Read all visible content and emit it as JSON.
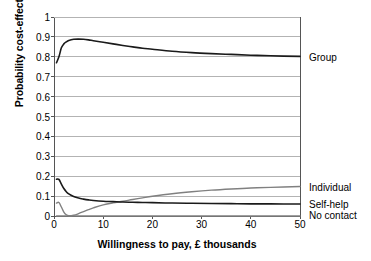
{
  "chart_data": {
    "type": "line",
    "title": "",
    "xlabel": "Willingness to pay, £ thousands",
    "ylabel": "Probability cost-effective",
    "xlim": [
      0,
      50
    ],
    "ylim": [
      0,
      1
    ],
    "grid": true,
    "grid_axis": "y",
    "legend_position": "right-of-plot-at-series-end",
    "xticks": [
      "0",
      "10",
      "20",
      "30",
      "40",
      "50"
    ],
    "xtick_values": [
      0,
      10,
      20,
      30,
      40,
      50
    ],
    "yticks": [
      "0",
      "0.1",
      "0.2",
      "0.3",
      "0.4",
      "0.5",
      "0.6",
      "0.7",
      "0.8",
      "0.9",
      "1"
    ],
    "ytick_values": [
      0,
      0.1,
      0.2,
      0.3,
      0.4,
      0.5,
      0.6,
      0.7,
      0.8,
      0.9,
      1
    ],
    "x": [
      0.5,
      1,
      1.5,
      2,
      2.5,
      3,
      4,
      5,
      6,
      7,
      8,
      10,
      12,
      14,
      16,
      18,
      20,
      24,
      28,
      32,
      36,
      40,
      44,
      50
    ],
    "series": [
      {
        "name": "Group",
        "color": "#1a1a1a",
        "label_y": 0.8,
        "values": [
          0.77,
          0.8,
          0.845,
          0.865,
          0.875,
          0.882,
          0.888,
          0.889,
          0.888,
          0.885,
          0.881,
          0.873,
          0.865,
          0.857,
          0.85,
          0.843,
          0.838,
          0.828,
          0.821,
          0.816,
          0.812,
          0.808,
          0.805,
          0.802
        ]
      },
      {
        "name": "Individual",
        "color": "#808080",
        "label_y": 0.148,
        "values": [
          0.065,
          0.068,
          0.045,
          0.02,
          0.006,
          0.001,
          0.004,
          0.012,
          0.022,
          0.032,
          0.041,
          0.056,
          0.066,
          0.074,
          0.083,
          0.091,
          0.099,
          0.112,
          0.122,
          0.13,
          0.136,
          0.141,
          0.144,
          0.148
        ]
      },
      {
        "name": "Self-help",
        "color": "#1a1a1a",
        "label_y": 0.062,
        "values": [
          0.185,
          0.184,
          0.16,
          0.138,
          0.122,
          0.111,
          0.098,
          0.09,
          0.085,
          0.081,
          0.078,
          0.074,
          0.072,
          0.07,
          0.069,
          0.068,
          0.067,
          0.065,
          0.064,
          0.063,
          0.062,
          0.061,
          0.061,
          0.06
        ]
      },
      {
        "name": "No contact",
        "color": "#808080",
        "label_y": 0.005,
        "values": [
          0.0,
          0.0,
          0.0,
          0.0,
          0.0,
          0.0,
          0.0,
          0.0,
          0.0,
          0.0,
          0.0,
          0.0,
          0.0,
          0.0,
          0.0,
          0.0,
          0.0,
          0.0,
          0.0,
          0.0,
          0.0,
          0.0,
          0.0,
          0.0
        ]
      }
    ]
  },
  "colors": {
    "axis": "#555555",
    "grid": "#b3b3b3",
    "dark_series": "#1a1a1a",
    "gray_series": "#808080",
    "background": "#ffffff"
  }
}
